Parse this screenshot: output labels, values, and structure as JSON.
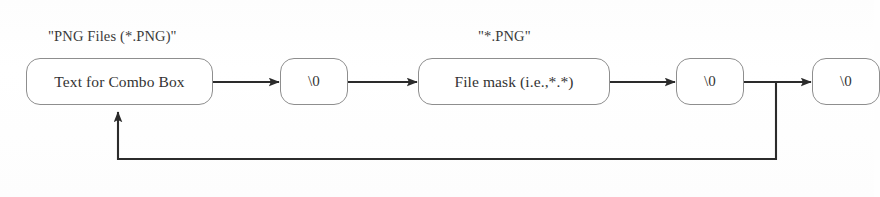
{
  "diagram": {
    "background_color": "#fefefe",
    "stroke_color": "#333333",
    "node_border_color": "#8e8e8e",
    "node_fill_color": "#ffffff",
    "nodes": [
      {
        "id": "combo-text",
        "label": "Text for Combo Box",
        "x": 26,
        "y": 58,
        "w": 187,
        "h": 47
      },
      {
        "id": "null-1",
        "label": "\\0",
        "x": 280,
        "y": 58,
        "w": 68,
        "h": 47
      },
      {
        "id": "file-mask",
        "label": "File mask (i.e.,*.*)",
        "x": 418,
        "y": 58,
        "w": 192,
        "h": 47
      },
      {
        "id": "null-2",
        "label": "\\0",
        "x": 676,
        "y": 58,
        "w": 68,
        "h": 47
      },
      {
        "id": "null-3",
        "label": "\\0",
        "x": 812,
        "y": 58,
        "w": 68,
        "h": 47
      }
    ],
    "annotations": [
      {
        "id": "annotation-png-files",
        "text": "\"PNG Files (*.PNG)\"",
        "x": 48,
        "y": 28
      },
      {
        "id": "annotation-png-mask",
        "text": "\"*.PNG\"",
        "x": 478,
        "y": 28
      }
    ],
    "edges": [
      {
        "id": "edge-combo-to-null1",
        "from": "combo-text",
        "to": "null-1",
        "type": "arrow"
      },
      {
        "id": "edge-null1-to-filemask",
        "from": "null-1",
        "to": "file-mask",
        "type": "arrow"
      },
      {
        "id": "edge-filemask-to-null2",
        "from": "file-mask",
        "to": "null-2",
        "type": "arrow"
      },
      {
        "id": "edge-null2-to-null3",
        "from": "null-2",
        "to": "null-3",
        "type": "arrow"
      },
      {
        "id": "edge-feedback-loop",
        "from": "null-2",
        "to": "combo-text",
        "type": "feedback-arrow"
      }
    ]
  }
}
